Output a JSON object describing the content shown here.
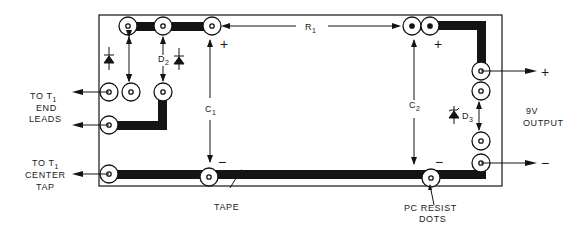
{
  "diagram": {
    "type": "pc-board-layout",
    "labels": {
      "to_t1_end_leads": [
        "TO T",
        "1",
        "END",
        "LEADS"
      ],
      "to_t1_center_tap": [
        "TO T",
        "1",
        "CENTER",
        "TAP"
      ],
      "tape": "TAPE",
      "pc_resist_dots": [
        "PC RESIST",
        "DOTS"
      ],
      "output": [
        "9V",
        "OUTPUT"
      ],
      "r1": "R",
      "r1_sub": "1",
      "c1": "C",
      "c1_sub": "1",
      "c2": "C",
      "c2_sub": "2",
      "d2": "D",
      "d2_sub": "2",
      "d3": "D",
      "d3_sub": "3",
      "plus": "+",
      "minus": "−"
    },
    "components": [
      {
        "ref": "D1",
        "kind": "diode"
      },
      {
        "ref": "D2",
        "kind": "diode"
      },
      {
        "ref": "D3",
        "kind": "zener-diode"
      },
      {
        "ref": "C1",
        "kind": "capacitor",
        "polarity": "+ top / − bottom"
      },
      {
        "ref": "C2",
        "kind": "capacitor",
        "polarity": "+ top / − bottom"
      },
      {
        "ref": "R1",
        "kind": "resistor"
      }
    ],
    "colors": {
      "ink": "#141414",
      "paper": "#ffffff"
    }
  }
}
